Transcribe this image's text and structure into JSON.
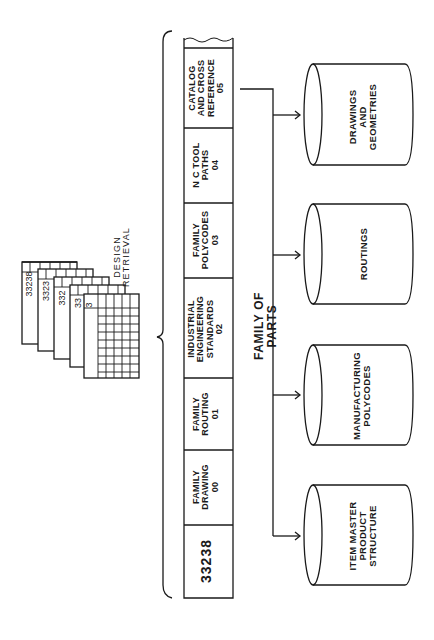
{
  "diagram": {
    "design_retrieval": {
      "label": "DESIGN\nRETRIEVAL",
      "cards": [
        "33238",
        "3323",
        "332",
        "33",
        "3"
      ]
    },
    "record": {
      "key": "33238",
      "segments": [
        {
          "label": "FAMILY\nDRAWING\n00"
        },
        {
          "label": "FAMILY\nROUTING\n01"
        },
        {
          "label": "INDUSTRIAL\nENGINEERING\nSTANDARDS\n02"
        },
        {
          "label": "FAMILY\nPOLYCODES\n03"
        },
        {
          "label": "N C TOOL\nPATHS\n04"
        },
        {
          "label": "CATALOG\nAND CROSS\nREFERENCE\n05"
        }
      ]
    },
    "group_label": "FAMILY OF PARTS",
    "databases": [
      {
        "label": "DRAWINGS\nAND\nGEOMETRIES"
      },
      {
        "label": "ROUTINGS"
      },
      {
        "label": "MANUFACTURING\nPOLYCODES"
      },
      {
        "label": "ITEM MASTER\nPRODUCT\nSTRUCTURE"
      }
    ],
    "colors": {
      "line": "#1a1a1a",
      "background": "#ffffff"
    }
  }
}
